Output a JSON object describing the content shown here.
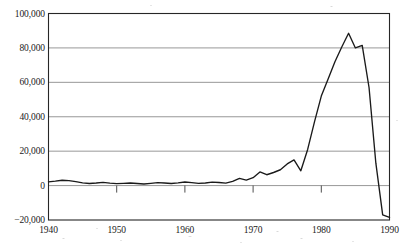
{
  "chart_data": {
    "type": "line",
    "title": "",
    "xlabel": "",
    "ylabel": "",
    "xlim": [
      1940,
      1990
    ],
    "ylim": [
      -20000,
      100000
    ],
    "grid": true,
    "legend": false,
    "y_ticks": [
      {
        "value": 100000,
        "label": "100,000"
      },
      {
        "value": 80000,
        "label": "80,000"
      },
      {
        "value": 60000,
        "label": "60,000"
      },
      {
        "value": 40000,
        "label": "40,000"
      },
      {
        "value": 20000,
        "label": "20,000"
      },
      {
        "value": 0,
        "label": "0"
      },
      {
        "value": -20000,
        "label": "−20,000"
      }
    ],
    "x_ticks": [
      {
        "value": 1940,
        "label": "1940"
      },
      {
        "value": 1950,
        "label": "1950"
      },
      {
        "value": 1960,
        "label": "1960"
      },
      {
        "value": 1970,
        "label": "1970"
      },
      {
        "value": 1980,
        "label": "1980"
      },
      {
        "value": 1990,
        "label": "1990"
      }
    ],
    "series": [
      {
        "name": "series-1",
        "color": "#1a1a1a",
        "x": [
          1940,
          1941,
          1942,
          1943,
          1944,
          1945,
          1946,
          1947,
          1948,
          1949,
          1950,
          1951,
          1952,
          1953,
          1954,
          1955,
          1956,
          1957,
          1958,
          1959,
          1960,
          1961,
          1962,
          1963,
          1964,
          1965,
          1966,
          1967,
          1968,
          1969,
          1970,
          1971,
          1972,
          1973,
          1974,
          1975,
          1976,
          1977,
          1978,
          1979,
          1980,
          1981,
          1982,
          1983,
          1984,
          1985,
          1986,
          1987,
          1988,
          1989,
          1990
        ],
        "y": [
          2200,
          2600,
          3100,
          2900,
          2300,
          1600,
          1200,
          1500,
          1900,
          1400,
          1100,
          1300,
          1500,
          1200,
          900,
          1300,
          1700,
          1500,
          1200,
          1600,
          2100,
          1700,
          1300,
          1500,
          2000,
          1800,
          1400,
          2400,
          4200,
          3200,
          4600,
          7900,
          6300,
          7600,
          9200,
          12600,
          14900,
          8600,
          21000,
          37000,
          52000,
          62000,
          72000,
          80500,
          88500,
          80000,
          81500,
          57000,
          13000,
          -17000,
          -18500
        ]
      }
    ]
  },
  "axes": {
    "frame_color": "#262626",
    "grid_color": "#8c8c8c",
    "background": "#ffffff"
  }
}
